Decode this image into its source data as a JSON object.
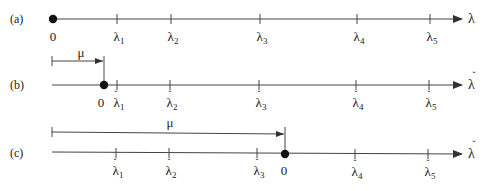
{
  "diagram": {
    "axis_color": "#333333",
    "rows": [
      {
        "label": "(a)",
        "axis_symbol": "λ",
        "axis_check": false,
        "zero_label": "0",
        "ticks": [
          {
            "sym": "λ",
            "sub": "1",
            "check": false
          },
          {
            "sym": "λ",
            "sub": "2",
            "check": false
          },
          {
            "sym": "λ",
            "sub": "3",
            "check": false
          },
          {
            "sym": "λ",
            "sub": "4",
            "check": false
          },
          {
            "sym": "λ",
            "sub": "5",
            "check": false
          }
        ]
      },
      {
        "label": "(b)",
        "axis_symbol": "λ",
        "axis_check": true,
        "zero_label": "0",
        "shift_label": "μ",
        "ticks": [
          {
            "sym": "λ",
            "sub": "1",
            "check": true
          },
          {
            "sym": "λ",
            "sub": "2",
            "check": true
          },
          {
            "sym": "λ",
            "sub": "3",
            "check": true
          },
          {
            "sym": "λ",
            "sub": "4",
            "check": true
          },
          {
            "sym": "λ",
            "sub": "5",
            "check": true
          }
        ]
      },
      {
        "label": "(c)",
        "axis_symbol": "λ",
        "axis_check": true,
        "zero_label": "0",
        "shift_label": "μ",
        "ticks": [
          {
            "sym": "λ",
            "sub": "1",
            "check": true
          },
          {
            "sym": "λ",
            "sub": "2",
            "check": true
          },
          {
            "sym": "λ",
            "sub": "3",
            "check": true
          },
          {
            "sym": "λ",
            "sub": "4",
            "check": true
          },
          {
            "sym": "λ",
            "sub": "5",
            "check": true
          }
        ]
      }
    ],
    "check_mark": "ˇ"
  }
}
